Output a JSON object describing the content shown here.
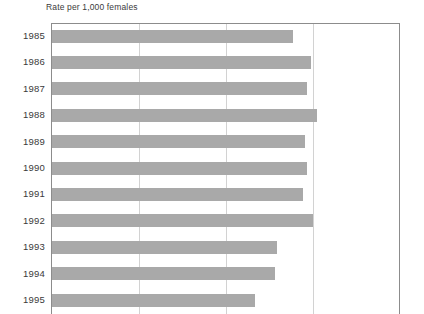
{
  "figure": {
    "background_color": "#ffffff",
    "width": 424,
    "height": 314
  },
  "axis_title": "Rate per 1,000 females",
  "style": {
    "bar_color": "#a9a9a9",
    "gridline_color": "#d2d2d2",
    "frame_color": "#8c8c8c",
    "text_color": "#3a3a3a"
  },
  "chart_data": {
    "type": "bar",
    "orientation": "horizontal",
    "title": "",
    "subtitle": "",
    "xlabel": "Rate per 1,000 females",
    "ylabel": "",
    "categories": [
      "1985",
      "1986",
      "1987",
      "1988",
      "1989",
      "1990",
      "1991",
      "1992",
      "1993",
      "1994",
      "1995"
    ],
    "values": [
      69.3,
      74.3,
      73.3,
      76.2,
      72.7,
      73.3,
      72.1,
      75.0,
      64.7,
      64.1,
      58.3
    ],
    "series": [
      {
        "name": "Rate per 1,000 females",
        "values": [
          69.3,
          74.3,
          73.3,
          76.2,
          72.7,
          73.3,
          72.1,
          75.0,
          64.7,
          64.1,
          58.3
        ]
      }
    ],
    "xlim": [
      0,
      100
    ],
    "ylim": [
      0,
      11
    ],
    "xticks": [
      0,
      25,
      50,
      75,
      100
    ],
    "xticklabels": [
      "",
      "",
      "",
      "",
      ""
    ],
    "grid": "vertical-only",
    "legend": "none",
    "legend_position": "none",
    "annotations": []
  }
}
